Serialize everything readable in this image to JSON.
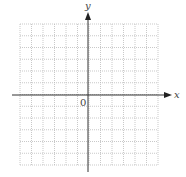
{
  "diagram": {
    "type": "coordinate-grid",
    "x_axis_label": "x",
    "y_axis_label": "y",
    "origin_label": "0",
    "grid": {
      "columns": 12,
      "rows": 12,
      "line_style": "dotted",
      "color": "#bbbbbb"
    },
    "axis_color": "#333333"
  }
}
